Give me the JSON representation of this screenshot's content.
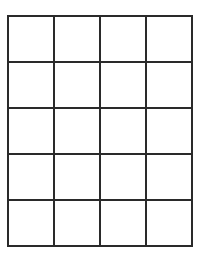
{
  "grid": {
    "columns": 4,
    "rows": 5,
    "cell_size_px": 46,
    "line_color": "#2a2a2a",
    "background_color": "#ffffff",
    "cells": [
      [
        "",
        "",
        "",
        ""
      ],
      [
        "",
        "",
        "",
        ""
      ],
      [
        "",
        "",
        "",
        ""
      ],
      [
        "",
        "",
        "",
        ""
      ],
      [
        "",
        "",
        "",
        ""
      ]
    ]
  }
}
